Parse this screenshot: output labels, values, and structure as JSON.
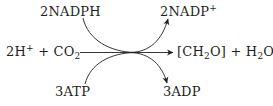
{
  "diagram": {
    "type": "reaction-scheme",
    "inputs": {
      "cofactor_top": {
        "coef": "2",
        "name": "NADPH"
      },
      "reactants": {
        "h_coef": "2",
        "h": "H",
        "h_charge": "+",
        "plus": "+",
        "co2": "CO",
        "co2_sub": "2"
      },
      "cofactor_bottom": {
        "coef": "3",
        "name": "ATP"
      }
    },
    "outputs": {
      "cofactor_top": {
        "coef": "2",
        "name": "NADP",
        "charge": "+"
      },
      "products": {
        "open": "[CH",
        "ch2o_sub": "2",
        "close": "O]",
        "plus": "+",
        "h2o_h": "H",
        "h2o_sub": "2",
        "h2o_o": "O"
      },
      "cofactor_bottom": {
        "coef": "3",
        "name": "ADP"
      }
    },
    "arrows": [
      {
        "from": "2H+ + CO2",
        "to": "[CH2O] + H2O",
        "style": "straight"
      },
      {
        "from": "2NADPH",
        "to": "2NADP+",
        "style": "curved"
      },
      {
        "from": "3ATP",
        "to": "3ADP",
        "style": "curved"
      }
    ],
    "line_color": "#231f20"
  }
}
